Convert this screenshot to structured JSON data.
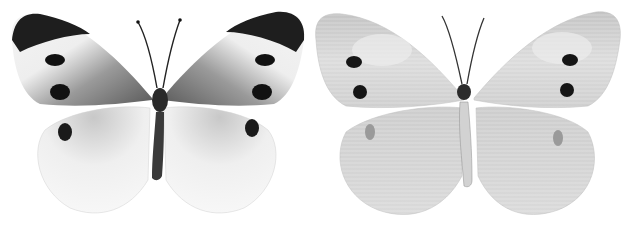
{
  "image": {
    "description": "Two specimens of a white butterfly (large white), upper side and under side, grayscale",
    "background": "#ffffff",
    "specimens": [
      {
        "view": "upperside",
        "wing_color": "#f2f2f2",
        "apex_color": "#1e1e1e",
        "base_color": "#6a6a6a",
        "spot_color": "#111111"
      },
      {
        "view": "underside",
        "wing_color": "#d6d6d6",
        "apex_color": "#bdbdbd",
        "base_color": "#a8a8a8",
        "spot_color": "#151515"
      }
    ]
  }
}
